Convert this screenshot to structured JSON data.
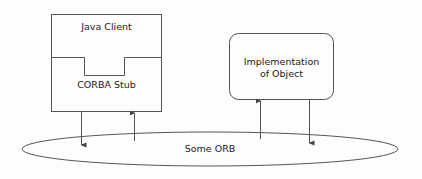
{
  "diagram": {
    "client": {
      "title": "Java Client",
      "stub_label": "CORBA Stub"
    },
    "implementation": {
      "line1": "Implementation",
      "line2": "of Object"
    },
    "orb": {
      "label": "Some ORB"
    },
    "arrows": [
      {
        "from": "CORBA Stub",
        "to": "Some ORB",
        "direction": "down"
      },
      {
        "from": "Some ORB",
        "to": "CORBA Stub",
        "direction": "up"
      },
      {
        "from": "Some ORB",
        "to": "Implementation of Object",
        "direction": "up"
      },
      {
        "from": "Implementation of Object",
        "to": "Some ORB",
        "direction": "down"
      }
    ],
    "colors": {
      "stroke": "#555555",
      "text": "#222222",
      "background": "#fdfdfd"
    }
  }
}
